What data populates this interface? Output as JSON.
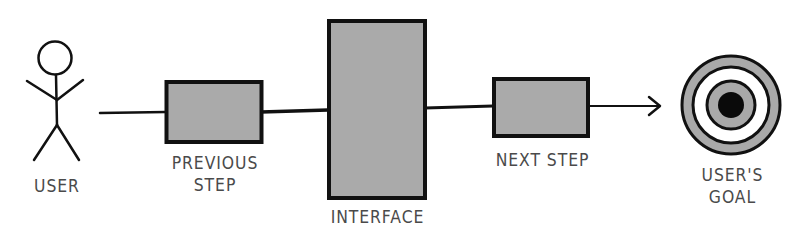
{
  "diagram": {
    "nodes": {
      "user": {
        "label": "USER"
      },
      "previous_step": {
        "label_line1": "PREVIOUS",
        "label_line2": "STEP"
      },
      "interface": {
        "label": "INTERFACE"
      },
      "next_step": {
        "label": "NEXT STEP"
      },
      "users_goal": {
        "label_line1": "USER'S",
        "label_line2": "GOAL"
      }
    },
    "colors": {
      "stroke": "#111111",
      "box_fill": "#aaaaaa",
      "target_ring": "#a9a9a9",
      "label": "#4a4a4a"
    }
  }
}
